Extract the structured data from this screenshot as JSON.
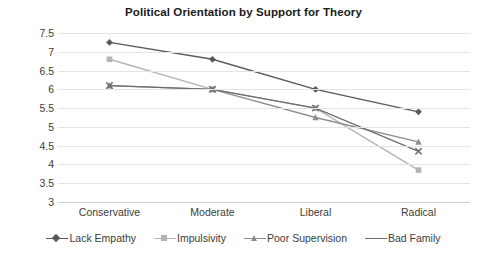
{
  "chart_data": {
    "type": "line",
    "title": "Political Orientation by Support for Theory",
    "xlabel": "",
    "ylabel": "",
    "categories": [
      "Conservative",
      "Moderate",
      "Liberal",
      "Radical"
    ],
    "ylim": [
      3,
      7.5
    ],
    "yticks": [
      7.5,
      7,
      6.5,
      6,
      5.5,
      5,
      4.5,
      4,
      3.5,
      3
    ],
    "ytick_labels": [
      "7.5",
      "7",
      "6.5",
      "6",
      "5.5",
      "5",
      "4.5",
      "4",
      "3.5",
      "3"
    ],
    "grid": true,
    "legend_position": "bottom",
    "series": [
      {
        "name": "Lack Empathy",
        "values": [
          7.25,
          6.8,
          6.0,
          5.4
        ],
        "color": "#58595b",
        "marker": "diamond"
      },
      {
        "name": "Impulsivity",
        "values": [
          6.8,
          6.0,
          5.5,
          3.85
        ],
        "color": "#b4b4b4",
        "marker": "square"
      },
      {
        "name": "Poor Supervision",
        "values": [
          6.1,
          6.0,
          5.25,
          4.6
        ],
        "color": "#8d8e90",
        "marker": "triangle"
      },
      {
        "name": "Bad Family",
        "values": [
          6.1,
          6.0,
          5.5,
          4.35
        ],
        "color": "#6d6e70",
        "marker": "x"
      }
    ]
  }
}
